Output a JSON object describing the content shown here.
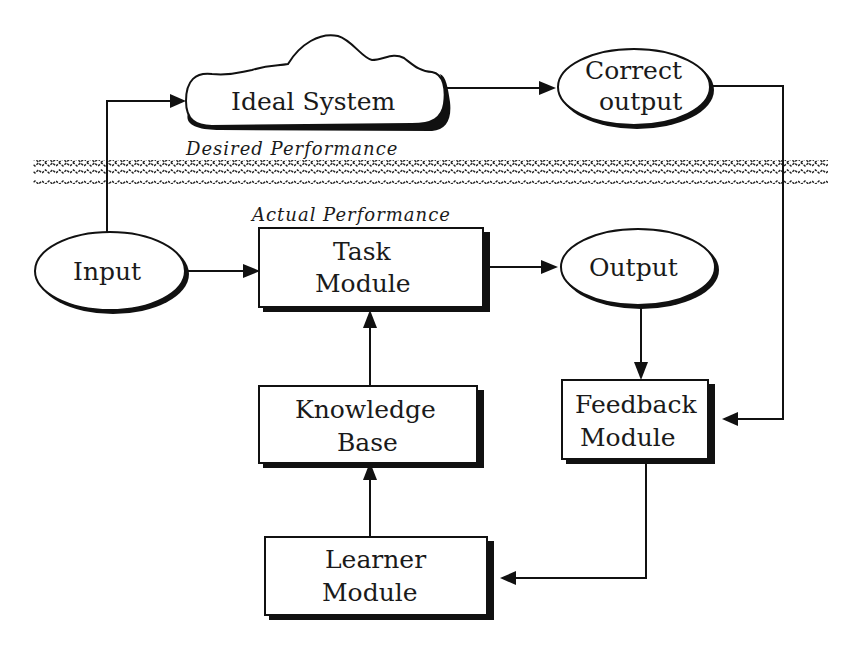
{
  "diagram": {
    "top_region_label": "Desired Performance",
    "bottom_region_label": "Actual Performance",
    "separator": "wavy-line",
    "nodes": {
      "ideal_system": {
        "label": "Ideal System",
        "shape": "cloud"
      },
      "correct_output": {
        "line1": "Correct",
        "line2": "output",
        "shape": "ellipse"
      },
      "input": {
        "label": "Input",
        "shape": "ellipse"
      },
      "task_module": {
        "line1": "Task",
        "line2": "Module",
        "shape": "rectangle"
      },
      "output": {
        "label": "Output",
        "shape": "ellipse"
      },
      "knowledge_base": {
        "line1": "Knowledge",
        "line2": "Base",
        "shape": "rectangle"
      },
      "feedback_module": {
        "line1": "Feedback",
        "line2": "Module",
        "shape": "rectangle"
      },
      "learner_module": {
        "line1": "Learner",
        "line2": "Module",
        "shape": "rectangle"
      }
    },
    "edges": [
      {
        "from": "Input",
        "to": "Ideal System"
      },
      {
        "from": "Ideal System",
        "to": "Correct output"
      },
      {
        "from": "Correct output",
        "to": "Feedback Module"
      },
      {
        "from": "Input",
        "to": "Task Module"
      },
      {
        "from": "Task Module",
        "to": "Output"
      },
      {
        "from": "Output",
        "to": "Feedback Module"
      },
      {
        "from": "Feedback Module",
        "to": "Learner Module"
      },
      {
        "from": "Learner Module",
        "to": "Knowledge Base"
      },
      {
        "from": "Knowledge Base",
        "to": "Task Module"
      }
    ]
  }
}
